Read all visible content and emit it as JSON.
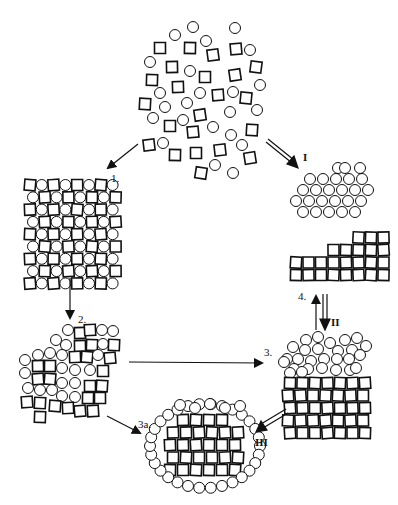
{
  "diagram": {
    "type": "particle-assembly-pathways",
    "colors": {
      "stroke": "#111111",
      "background": "#ffffff"
    },
    "particle_types": [
      "circle",
      "square"
    ],
    "states": [
      {
        "id": "disordered-mixture",
        "description": "random dispersed circles and squares",
        "center": [
          200,
          90
        ]
      },
      {
        "id": "mixed-cluster-1",
        "description": "mixed ordered aggregate of squares and circles",
        "center": [
          62,
          228
        ]
      },
      {
        "id": "circle-crystal",
        "description": "close-packed circles only",
        "center": [
          330,
          186
        ]
      },
      {
        "id": "square-crystal",
        "description": "packed squares only",
        "center": [
          330,
          258
        ]
      },
      {
        "id": "mixed-cluster-2",
        "description": "partially segregated aggregate",
        "center": [
          65,
          365
        ]
      },
      {
        "id": "layered-bicrystal",
        "description": "circle layer atop square layer",
        "center": [
          333,
          372
        ]
      },
      {
        "id": "core-shell",
        "description": "square core surrounded by circle shell",
        "center": [
          205,
          445
        ]
      }
    ],
    "arrows": [
      {
        "from": "disordered-mixture",
        "to": "mixed-cluster-1",
        "label": "1.",
        "style": "single"
      },
      {
        "from": "disordered-mixture",
        "to": "circle-crystal",
        "label": "I",
        "style": "double"
      },
      {
        "from": "mixed-cluster-1",
        "to": "mixed-cluster-2",
        "label": "2.",
        "style": "single"
      },
      {
        "from": "mixed-cluster-2",
        "to": "layered-bicrystal",
        "label": "3.",
        "style": "single"
      },
      {
        "from": "mixed-cluster-2",
        "to": "core-shell",
        "label": "3a.",
        "style": "single"
      },
      {
        "from": "layered-bicrystal",
        "to": "square-crystal",
        "label": "4.",
        "style": "single"
      },
      {
        "from": "square-crystal",
        "to": "layered-bicrystal",
        "label": "II",
        "style": "double"
      },
      {
        "from": "layered-bicrystal",
        "to": "core-shell",
        "label": "III",
        "style": "double"
      }
    ],
    "labels": {
      "step1": "1.",
      "step2": "2.",
      "step3": "3.",
      "step3a": "3a.",
      "step4": "4.",
      "pathI": "I",
      "pathII": "II",
      "pathIII": "III"
    }
  }
}
